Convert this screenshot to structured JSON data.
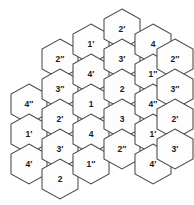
{
  "figure": {
    "name": "hexagonal-tiling-labeled-cells",
    "background_color": "#ffffff",
    "stroke_color": "#4a4a4a",
    "label_color": "#1a1a1a",
    "hex_orientation": "pointy-top",
    "hex_width": 36,
    "hex_height": 40,
    "columns_count": 5,
    "cells_count": 25
  },
  "cells": [
    {
      "id": "c1r1",
      "label": "4",
      "mark": "″",
      "text": "4″",
      "col": 1,
      "row": 1,
      "cx": 29,
      "cy": 104
    },
    {
      "id": "c1r2",
      "label": "1",
      "mark": "′",
      "text": "1′",
      "col": 1,
      "row": 2,
      "cx": 29,
      "cy": 134
    },
    {
      "id": "c1r3",
      "label": "4",
      "mark": "′",
      "text": "4′",
      "col": 1,
      "row": 3,
      "cx": 29,
      "cy": 164
    },
    {
      "id": "c2r1",
      "label": "2",
      "mark": "″",
      "text": "2″",
      "col": 2,
      "row": 1,
      "cx": 60,
      "cy": 59
    },
    {
      "id": "c2r2",
      "label": "3",
      "mark": "″",
      "text": "3″",
      "col": 2,
      "row": 2,
      "cx": 60,
      "cy": 89
    },
    {
      "id": "c2r3",
      "label": "2",
      "mark": "′",
      "text": "2′",
      "col": 2,
      "row": 3,
      "cx": 60,
      "cy": 119
    },
    {
      "id": "c2r4",
      "label": "3",
      "mark": "′",
      "text": "3′",
      "col": 2,
      "row": 4,
      "cx": 60,
      "cy": 149
    },
    {
      "id": "c2r5",
      "label": "2",
      "mark": "",
      "text": "2",
      "col": 2,
      "row": 5,
      "cx": 60,
      "cy": 179
    },
    {
      "id": "c3r1",
      "label": "1",
      "mark": "′",
      "text": "1′",
      "col": 3,
      "row": 1,
      "cx": 91,
      "cy": 44
    },
    {
      "id": "c3r2",
      "label": "4",
      "mark": "′",
      "text": "4′",
      "col": 3,
      "row": 2,
      "cx": 91,
      "cy": 74
    },
    {
      "id": "c3r3",
      "label": "1",
      "mark": "",
      "text": "1",
      "col": 3,
      "row": 3,
      "cx": 91,
      "cy": 104
    },
    {
      "id": "c3r4",
      "label": "4",
      "mark": "",
      "text": "4",
      "col": 3,
      "row": 4,
      "cx": 91,
      "cy": 134
    },
    {
      "id": "c3r5",
      "label": "1",
      "mark": "″",
      "text": "1″",
      "col": 3,
      "row": 5,
      "cx": 91,
      "cy": 164
    },
    {
      "id": "c4r1",
      "label": "2",
      "mark": "′",
      "text": "2′",
      "col": 4,
      "row": 1,
      "cx": 122,
      "cy": 29
    },
    {
      "id": "c4r2",
      "label": "3",
      "mark": "′",
      "text": "3′",
      "col": 4,
      "row": 2,
      "cx": 122,
      "cy": 59
    },
    {
      "id": "c4r3",
      "label": "2",
      "mark": "",
      "text": "2",
      "col": 4,
      "row": 3,
      "cx": 122,
      "cy": 89
    },
    {
      "id": "c4r4",
      "label": "3",
      "mark": "",
      "text": "3",
      "col": 4,
      "row": 4,
      "cx": 122,
      "cy": 119
    },
    {
      "id": "c4r5",
      "label": "2",
      "mark": "″",
      "text": "2″",
      "col": 4,
      "row": 5,
      "cx": 122,
      "cy": 149
    },
    {
      "id": "c5r1",
      "label": "4",
      "mark": "",
      "text": "4",
      "col": 5,
      "row": 1,
      "cx": 153,
      "cy": 44
    },
    {
      "id": "c5r2",
      "label": "1",
      "mark": "″",
      "text": "1″",
      "col": 5,
      "row": 2,
      "cx": 153,
      "cy": 74
    },
    {
      "id": "c5r3",
      "label": "4",
      "mark": "″",
      "text": "4″",
      "col": 5,
      "row": 3,
      "cx": 153,
      "cy": 104
    },
    {
      "id": "c5r4",
      "label": "1",
      "mark": "′",
      "text": "1′",
      "col": 5,
      "row": 4,
      "cx": 153,
      "cy": 134
    },
    {
      "id": "c5r5",
      "label": "4",
      "mark": "′",
      "text": "4′",
      "col": 5,
      "row": 5,
      "cx": 153,
      "cy": 164
    },
    {
      "id": "c6r1",
      "label": "2",
      "mark": "″",
      "text": "2″",
      "col": 6,
      "row": 1,
      "cx": 175,
      "cy": 59
    },
    {
      "id": "c6r2",
      "label": "3",
      "mark": "″",
      "text": "3″",
      "col": 6,
      "row": 2,
      "cx": 175,
      "cy": 89
    },
    {
      "id": "c6r3",
      "label": "2",
      "mark": "′",
      "text": "2′",
      "col": 6,
      "row": 3,
      "cx": 175,
      "cy": 119
    },
    {
      "id": "c6r4",
      "label": "3",
      "mark": "′",
      "text": "3′",
      "col": 6,
      "row": 4,
      "cx": 175,
      "cy": 149
    }
  ]
}
